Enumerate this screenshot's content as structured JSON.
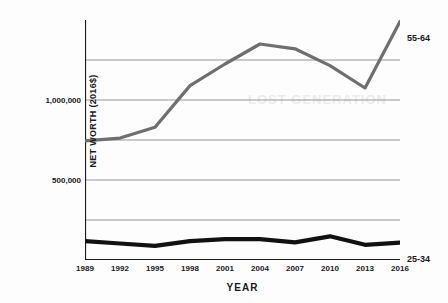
{
  "chart_data": {
    "type": "line",
    "title": "",
    "xlabel": "YEAR",
    "ylabel": "NET WORTH (2016$)",
    "x": [
      1989,
      1992,
      1995,
      1998,
      2001,
      2004,
      2007,
      2010,
      2013,
      2016
    ],
    "categories": [
      "1989",
      "1992",
      "1995",
      "1998",
      "2001",
      "2004",
      "2007",
      "2010",
      "2013",
      "2016"
    ],
    "xlim": [
      1989,
      2016
    ],
    "ylim": [
      0,
      1500000
    ],
    "grid": true,
    "gridlines_y": [
      250000,
      500000,
      750000,
      1000000,
      1250000
    ],
    "ytick_labels": [
      "500,000",
      "1,000,000"
    ],
    "ytick_values": [
      500000,
      1000000
    ],
    "legend_position": "right-inline",
    "series": [
      {
        "name": "55-64",
        "color": "#6f6f6f",
        "width": 3.2,
        "label_text": "55-64",
        "values": [
          745000,
          762000,
          830000,
          1090000,
          1225000,
          1350000,
          1320000,
          1215000,
          1075000,
          1490000
        ]
      },
      {
        "name": "25-34",
        "color": "#111111",
        "width": 4.2,
        "label_text": "25-34",
        "values": [
          118000,
          103000,
          88000,
          118000,
          130000,
          131000,
          110000,
          148000,
          95000,
          108000
        ]
      }
    ]
  },
  "ghost_text": {
    "mid": "LOST GENERATION",
    "top": ""
  }
}
